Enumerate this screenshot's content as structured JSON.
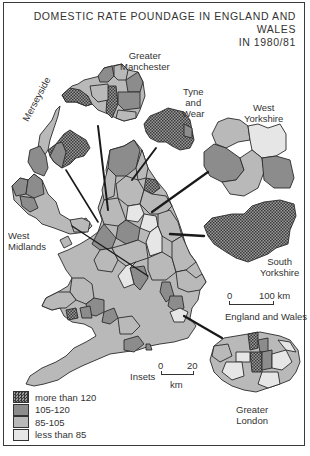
{
  "title": {
    "line1": "DOMESTIC RATE POUNDAGE IN ENGLAND AND WALES",
    "line2": "IN 1980/81"
  },
  "insets": {
    "greater_manchester": {
      "line1": "Greater",
      "line2": "Manchester"
    },
    "tyne_and_wear": {
      "line1": "Tyne",
      "line2": "and",
      "line3": "Wear"
    },
    "west_yorkshire": {
      "line1": "West",
      "line2": "Yorkshire"
    },
    "merseyside": "Merseyside",
    "west_midlands": {
      "line1": "West",
      "line2": "Midlands"
    },
    "south_yorkshire": {
      "line1": "South",
      "line2": "Yorkshire"
    },
    "greater_london": {
      "line1": "Greater",
      "line2": "London"
    }
  },
  "scale_main": {
    "start": "0",
    "end": "100 km",
    "caption": "England and Wales"
  },
  "scale_insets": {
    "label": "Insets",
    "start": "0",
    "end": "20",
    "unit": "km"
  },
  "legend": {
    "items": [
      {
        "label": "more than 120",
        "color": "#5a5a5a",
        "pattern": "crosshatch"
      },
      {
        "label": "105-120",
        "color": "#8c8c8c",
        "pattern": "solid"
      },
      {
        "label": "85-105",
        "color": "#b9b9b9",
        "pattern": "solid"
      },
      {
        "label": "less than 85",
        "color": "#e6e6e6",
        "pattern": "solid"
      }
    ]
  },
  "colors": {
    "c1": "#5a5a5a",
    "c2": "#8c8c8c",
    "c3": "#b9b9b9",
    "c4": "#e6e6e6",
    "outline": "#2a2a2a"
  }
}
